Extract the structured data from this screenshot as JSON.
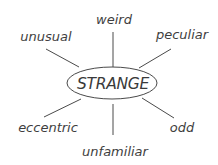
{
  "diagram": {
    "type": "word-web",
    "center": {
      "label": "STRANGE",
      "ellipse": {
        "cx": 112,
        "cy": 83,
        "rx": 45,
        "ry": 16
      },
      "text_x": 113,
      "text_y": 89
    },
    "related_words": [
      {
        "id": "weird",
        "label": "weird",
        "text_x": 114,
        "text_y": 24,
        "anchor": "middle",
        "line": {
          "x1": 113,
          "y1": 32,
          "x2": 113,
          "y2": 67
        }
      },
      {
        "id": "peculiar",
        "label": "peculiar",
        "text_x": 182,
        "text_y": 39,
        "anchor": "middle",
        "line": {
          "x1": 171,
          "y1": 49,
          "x2": 139,
          "y2": 68
        }
      },
      {
        "id": "unusual",
        "label": "unusual",
        "text_x": 46,
        "text_y": 41,
        "anchor": "middle",
        "line": {
          "x1": 46,
          "y1": 49,
          "x2": 79,
          "y2": 67
        }
      },
      {
        "id": "eccentric",
        "label": "eccentric",
        "text_x": 48,
        "text_y": 132,
        "anchor": "middle",
        "line": {
          "x1": 81,
          "y1": 99,
          "x2": 44,
          "y2": 117
        }
      },
      {
        "id": "odd",
        "label": "odd",
        "text_x": 182,
        "text_y": 132,
        "anchor": "middle",
        "line": {
          "x1": 142,
          "y1": 98,
          "x2": 174,
          "y2": 118
        }
      },
      {
        "id": "unfamiliar",
        "label": "unfamiliar",
        "text_x": 115,
        "text_y": 156,
        "anchor": "middle",
        "line": {
          "x1": 113,
          "y1": 104,
          "x2": 113,
          "y2": 135
        }
      }
    ],
    "colors": {
      "text": "#3e3e3e",
      "lines": "#4a4a4a",
      "background": "#ffffff"
    }
  }
}
